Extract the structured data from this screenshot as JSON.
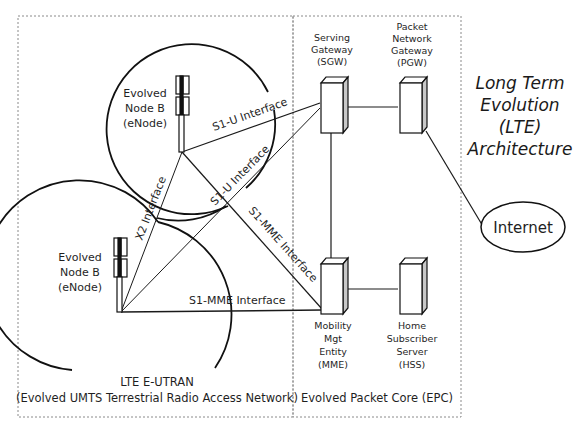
{
  "title": {
    "lines": [
      "Long Term",
      "Evolution",
      "(LTE)",
      "Architecture"
    ]
  },
  "eutran": {
    "caption_line1": "LTE E-UTRAN",
    "caption_line2": "(Evolved UMTS Terrestrial Radio Access Network)",
    "enode_top": {
      "lines": [
        "Evolved",
        "Node B",
        "(eNode)"
      ]
    },
    "enode_bottom": {
      "lines": [
        "Evolved",
        "Node B",
        "(eNode)"
      ]
    }
  },
  "epc": {
    "caption": "Evolved Packet Core (EPC)",
    "sgw": {
      "lines": [
        "Serving",
        "Gateway",
        "(SGW)"
      ]
    },
    "pgw": {
      "lines": [
        "Packet",
        "Network",
        "Gateway",
        "(PGW)"
      ]
    },
    "mme": {
      "lines": [
        "Mobility",
        "Mgt",
        "Entity",
        "(MME)"
      ]
    },
    "hss": {
      "lines": [
        "Home",
        "Subscriber",
        "Server",
        "(HSS)"
      ]
    }
  },
  "internet": {
    "label": "Internet"
  },
  "interfaces": {
    "s1u_top": "S1-U Interface",
    "s1u_diag": "S1-U Interface",
    "x2": "X2 Interface",
    "s1mme_diag": "S1-MME Interface",
    "s1mme_bottom": "S1-MME Interface"
  },
  "colors": {
    "line": "#1a1a1a",
    "box_border": "#888888",
    "server_side": "#c8c8c8"
  }
}
